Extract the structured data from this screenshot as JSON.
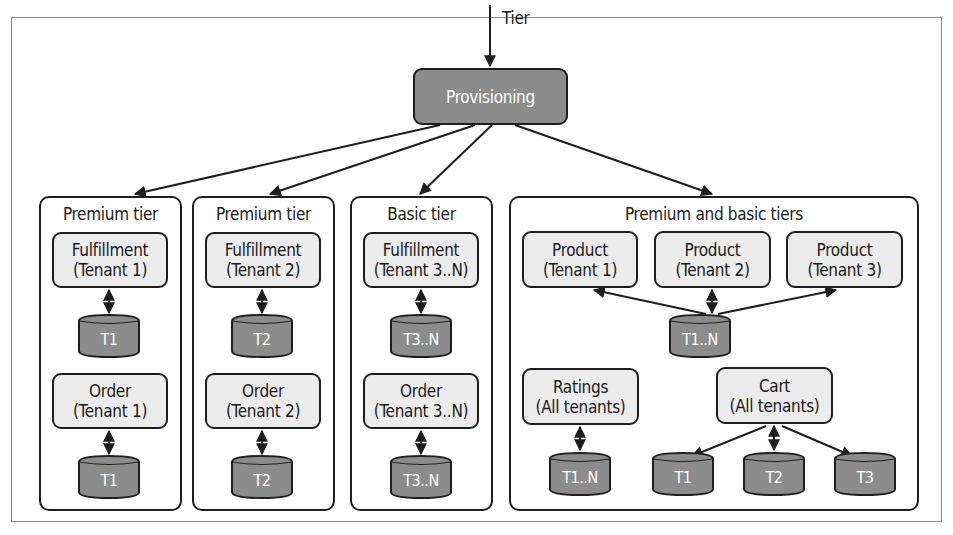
{
  "input": {
    "label": "Tier"
  },
  "provisioning": {
    "label": "Provisioning"
  },
  "tiers": [
    {
      "title": "Premium tier",
      "services": [
        {
          "name": "Fulfillment",
          "scope": "(Tenant 1)",
          "db": "T1"
        },
        {
          "name": "Order",
          "scope": "(Tenant 1)",
          "db": "T1"
        }
      ]
    },
    {
      "title": "Premium tier",
      "services": [
        {
          "name": "Fulfillment",
          "scope": "(Tenant 2)",
          "db": "T2"
        },
        {
          "name": "Order",
          "scope": "(Tenant 2)",
          "db": "T2"
        }
      ]
    },
    {
      "title": "Basic tier",
      "services": [
        {
          "name": "Fulfillment",
          "scope": "(Tenant 3..N)",
          "db": "T3..N"
        },
        {
          "name": "Order",
          "scope": "(Tenant 3..N)",
          "db": "T3..N"
        }
      ]
    },
    {
      "title": "Premium and basic tiers",
      "products": [
        {
          "name": "Product",
          "scope": "(Tenant 1)"
        },
        {
          "name": "Product",
          "scope": "(Tenant 2)"
        },
        {
          "name": "Product",
          "scope": "(Tenant 3)"
        }
      ],
      "product_db": "T1..N",
      "ratings": {
        "name": "Ratings",
        "scope": "(All tenants)",
        "db": "T1..N"
      },
      "cart": {
        "name": "Cart",
        "scope": "(All tenants)",
        "dbs": [
          "T1",
          "T2",
          "T3"
        ]
      }
    }
  ],
  "colors": {
    "service_fill": "#ececec",
    "db_fill": "#8c8c8c",
    "provisioning_fill": "#8c8c8c",
    "stroke": "#1e1e1e"
  }
}
